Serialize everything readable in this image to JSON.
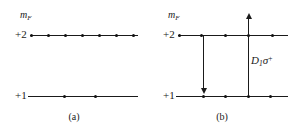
{
  "figure": {
    "width": 296,
    "height": 129,
    "background_color": "#ffffff",
    "ink_color": "#1a1a1a"
  },
  "panels": [
    {
      "id": "a",
      "caption": "(a)",
      "axis_label": "m",
      "axis_label_subscript": "F",
      "levels": [
        {
          "label": "+2",
          "y": 35,
          "line_x1": 30,
          "line_x2": 138,
          "dot_count": 7,
          "dots_x": [
            31,
            48,
            65,
            82,
            99,
            116,
            133
          ]
        },
        {
          "label": "+1",
          "y": 96,
          "line_x1": 28,
          "line_x2": 138,
          "dot_count": 2,
          "dots_x": [
            64,
            95
          ]
        }
      ],
      "arrows": []
    },
    {
      "id": "b",
      "caption": "(b)",
      "axis_label": "m",
      "axis_label_subscript": "F",
      "levels": [
        {
          "label": "+2",
          "y": 35,
          "line_x1": 30,
          "line_x2": 140,
          "dot_count": 5,
          "dots_x": [
            31,
            53,
            77,
            100,
            124
          ]
        },
        {
          "label": "+1",
          "y": 96,
          "line_x1": 28,
          "line_x2": 140,
          "dot_count": 4,
          "dots_x": [
            55,
            77,
            100,
            122
          ]
        }
      ],
      "arrows": [
        {
          "name": "decay-arrow",
          "direction": "down",
          "x": 55,
          "y_top": 35,
          "y_bottom": 96,
          "label": ""
        },
        {
          "name": "pump-arrow",
          "direction": "up",
          "x": 100,
          "y_top": 13,
          "y_bottom": 96,
          "label_main": "D",
          "label_sub": "1",
          "label_sup": "+",
          "label_sigma": "σ",
          "label_x": 103,
          "label_y": 60
        }
      ]
    }
  ]
}
